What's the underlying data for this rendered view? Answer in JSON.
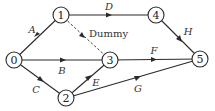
{
  "diagram": {
    "type": "activity-network",
    "nodes": [
      {
        "id": "0",
        "label": "0",
        "x": 14,
        "y": 60
      },
      {
        "id": "1",
        "label": "1",
        "x": 61,
        "y": 15
      },
      {
        "id": "2",
        "label": "2",
        "x": 66,
        "y": 98
      },
      {
        "id": "3",
        "label": "3",
        "x": 110,
        "y": 60
      },
      {
        "id": "4",
        "label": "4",
        "x": 156,
        "y": 15
      },
      {
        "id": "5",
        "label": "5",
        "x": 200,
        "y": 59
      }
    ],
    "edges": [
      {
        "from": "0",
        "to": "1",
        "label": "A"
      },
      {
        "from": "0",
        "to": "3",
        "label": "B"
      },
      {
        "from": "0",
        "to": "2",
        "label": "C"
      },
      {
        "from": "1",
        "to": "4",
        "label": "D"
      },
      {
        "from": "2",
        "to": "3",
        "label": "E"
      },
      {
        "from": "3",
        "to": "5",
        "label": "F"
      },
      {
        "from": "2",
        "to": "5",
        "label": "G"
      },
      {
        "from": "4",
        "to": "5",
        "label": "H"
      },
      {
        "from": "1",
        "to": "3",
        "label": "Dummy",
        "style": "dashed"
      }
    ]
  }
}
